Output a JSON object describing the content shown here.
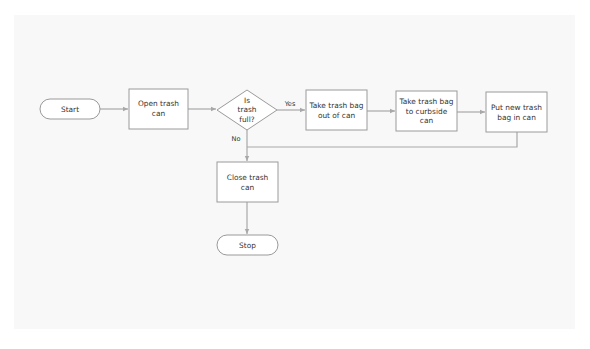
{
  "diagram": {
    "type": "flowchart",
    "colors": {
      "background": "#ffffff",
      "panel": "#f8f8f8",
      "node_fill": "#ffffff",
      "node_stroke": "#9a9a9a",
      "edge": "#a8a8a8",
      "text": "#333333"
    },
    "nodes": [
      {
        "id": "start",
        "shape": "terminal",
        "lines": [
          "Start"
        ]
      },
      {
        "id": "open",
        "shape": "process",
        "lines": [
          "Open trash",
          "can"
        ]
      },
      {
        "id": "decision",
        "shape": "decision",
        "lines": [
          "Is",
          "trash",
          "full?"
        ]
      },
      {
        "id": "take_out",
        "shape": "process",
        "lines": [
          "Take trash bag",
          "out of can"
        ]
      },
      {
        "id": "curbside",
        "shape": "process",
        "lines": [
          "Take trash bag",
          "to curbside",
          "can"
        ]
      },
      {
        "id": "put_new",
        "shape": "process",
        "lines": [
          "Put new trash",
          "bag in can"
        ]
      },
      {
        "id": "close",
        "shape": "process",
        "lines": [
          "Close trash",
          "can"
        ]
      },
      {
        "id": "stop",
        "shape": "terminal",
        "lines": [
          "Stop"
        ]
      }
    ],
    "edges": [
      {
        "from": "start",
        "to": "open",
        "label": ""
      },
      {
        "from": "open",
        "to": "decision",
        "label": ""
      },
      {
        "from": "decision",
        "to": "take_out",
        "label": "Yes"
      },
      {
        "from": "take_out",
        "to": "curbside",
        "label": ""
      },
      {
        "from": "curbside",
        "to": "put_new",
        "label": ""
      },
      {
        "from": "put_new",
        "to": "close",
        "label": ""
      },
      {
        "from": "decision",
        "to": "close",
        "label": "No"
      },
      {
        "from": "close",
        "to": "stop",
        "label": ""
      }
    ],
    "labels": {
      "start": "Start",
      "open_1": "Open trash",
      "open_2": "can",
      "decision_1": "Is",
      "decision_2": "trash",
      "decision_3": "full?",
      "take_out_1": "Take trash bag",
      "take_out_2": "out of can",
      "curbside_1": "Take trash bag",
      "curbside_2": "to curbside",
      "curbside_3": "can",
      "put_new_1": "Put new trash",
      "put_new_2": "bag in can",
      "close_1": "Close trash",
      "close_2": "can",
      "stop": "Stop",
      "yes": "Yes",
      "no": "No"
    }
  }
}
